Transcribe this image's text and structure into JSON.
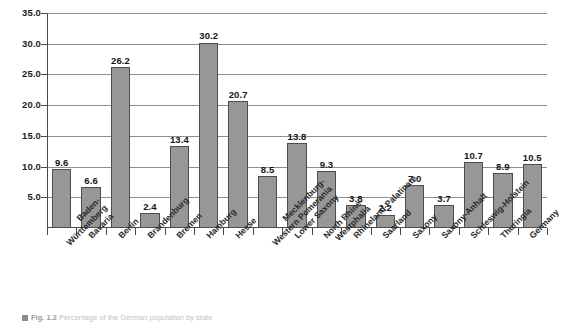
{
  "chart_data": {
    "type": "bar",
    "title": "",
    "xlabel": "",
    "ylabel": "",
    "ylim": [
      0,
      35
    ],
    "ytick_step": 5,
    "grid": true,
    "legend": "none",
    "orientation": "vertical",
    "bar_color": "#979797",
    "bar_border_color": "#4d4d4d",
    "ytick_labels": [
      "35.0",
      "30.0",
      "25.0",
      "20.0",
      "15.0",
      "10.0",
      "5.0"
    ],
    "ytick_values": [
      35,
      30,
      25,
      20,
      15,
      10,
      5
    ],
    "categories": [
      "Baden-Württemberg",
      "Bavaria",
      "Berlin",
      "Brandenburg",
      "Bremen",
      "Hamburg",
      "Hesse",
      "Mecklenburg-Western Pomerania",
      "Lower Saxony",
      "North Rhine-Westphalia",
      "Rhineland-Palatinate",
      "Saarland",
      "Saxony",
      "Saxony-Anhalt",
      "Schleswig-Holstein",
      "Thuringia",
      "Germany"
    ],
    "category_lines": [
      [
        "Baden-",
        "Württemberg"
      ],
      [
        "Bavaria"
      ],
      [
        "Berlin"
      ],
      [
        "Brandenburg"
      ],
      [
        "Bremen"
      ],
      [
        "Hamburg"
      ],
      [
        "Hesse"
      ],
      [
        "Mecklenburg-",
        "Western Pomerania"
      ],
      [
        "Lower Saxony"
      ],
      [
        "North Rhine-",
        "Westphalia"
      ],
      [
        "Rhineland-Palatinate"
      ],
      [
        "Saarland"
      ],
      [
        "Saxony"
      ],
      [
        "Saxony-Anhalt"
      ],
      [
        "Schleswig-Holstein"
      ],
      [
        "Thuringia"
      ],
      [
        "Germany"
      ]
    ],
    "values": [
      9.6,
      6.6,
      26.2,
      2.4,
      13.4,
      30.2,
      20.7,
      8.5,
      13.8,
      9.3,
      3.8,
      2.2,
      7.0,
      3.7,
      10.7,
      8.9,
      10.5
    ],
    "value_labels": [
      "9.6",
      "6.6",
      "26.2",
      "2.4",
      "13.4",
      "30.2",
      "20.7",
      "8.5",
      "13.8",
      "9.3",
      "3.8",
      "2.2",
      "7.0",
      "3.7",
      "10.7",
      "8.9",
      "10.5"
    ]
  },
  "caption": {
    "marker": "fig-marker-icon",
    "figure_label": "Fig. 1.2",
    "text": "Percentage of the German population by state"
  }
}
